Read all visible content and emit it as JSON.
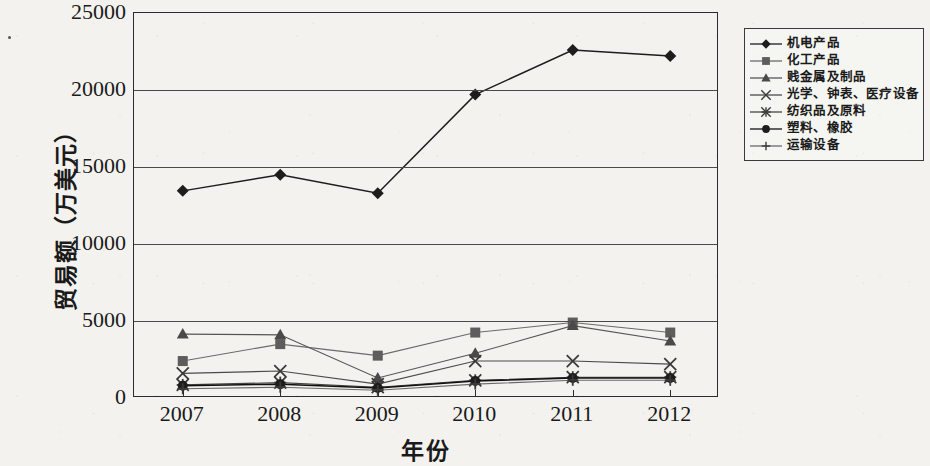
{
  "chart_data": {
    "type": "line",
    "title": "",
    "xlabel": "年份",
    "ylabel": "贸易额（万美元）",
    "categories": [
      "2007",
      "2008",
      "2009",
      "2010",
      "2011",
      "2012"
    ],
    "ylim": [
      0,
      25000
    ],
    "ytick_labels": [
      "0",
      "5000",
      "10000",
      "15000",
      "20000",
      "25000"
    ],
    "ytick_values": [
      0,
      5000,
      10000,
      15000,
      20000,
      25000
    ],
    "grid": true,
    "legend_position": "right",
    "series": [
      {
        "name": "机电产品",
        "marker": "diamond",
        "values": [
          13450,
          14500,
          13300,
          19700,
          22600,
          22200
        ]
      },
      {
        "name": "化工产品",
        "marker": "square",
        "values": [
          2400,
          3500,
          2750,
          4250,
          4900,
          4250
        ]
      },
      {
        "name": "贱金属及制品",
        "marker": "triangle",
        "values": [
          4150,
          4100,
          1300,
          2900,
          4700,
          3700
        ]
      },
      {
        "name": "光学、钟表、医疗设备",
        "marker": "x",
        "values": [
          1600,
          1750,
          900,
          2400,
          2400,
          2200
        ]
      },
      {
        "name": "纺织品及原料",
        "marker": "asterisk",
        "values": [
          850,
          1000,
          700,
          1150,
          1350,
          1350
        ]
      },
      {
        "name": "塑料、橡胶",
        "marker": "circle",
        "values": [
          800,
          900,
          650,
          1100,
          1300,
          1300
        ]
      },
      {
        "name": "运输设备",
        "marker": "plus",
        "values": [
          600,
          700,
          500,
          900,
          1150,
          1150
        ]
      }
    ]
  },
  "axis": {
    "y_title": "贸易额（万美元）",
    "x_title": "年份"
  }
}
